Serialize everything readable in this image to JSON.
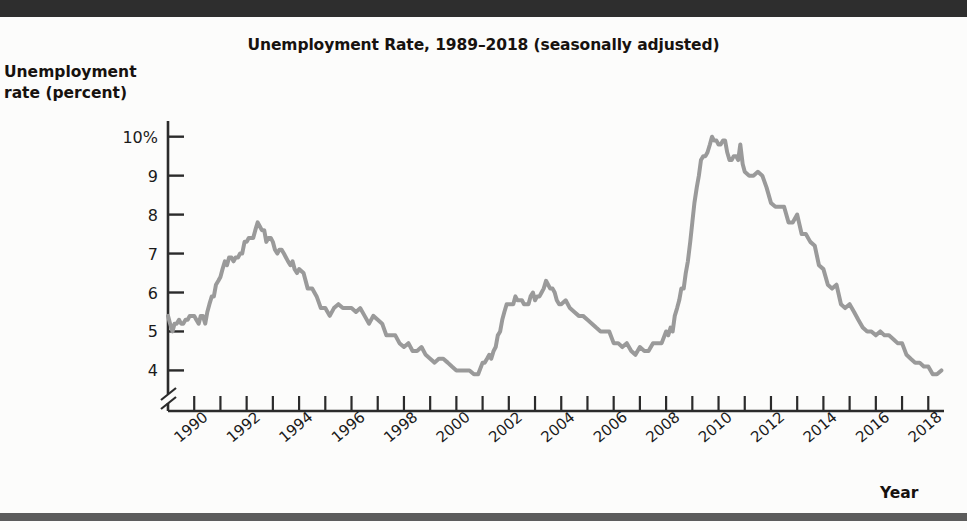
{
  "figure": {
    "title": "Unemployment Rate, 1989–2018 (seasonally adjusted)",
    "y_axis_label_line1": "Unemployment",
    "y_axis_label_line2": "rate (percent)",
    "x_axis_label": "Year"
  },
  "chart_data": {
    "type": "line",
    "title": "Unemployment Rate, 1989–2018 (seasonally adjusted)",
    "xlabel": "Year",
    "ylabel": "Unemployment rate (percent)",
    "xlim": [
      1989.0,
      2018.6
    ],
    "ylim": [
      3.6,
      10.3
    ],
    "yticks": [
      4,
      5,
      6,
      7,
      8,
      9,
      10
    ],
    "ytick_labels": [
      "4",
      "5",
      "6",
      "7",
      "8",
      "9",
      "10%"
    ],
    "y_axis_break": true,
    "grid": false,
    "legend": null,
    "line_color": "#9a9a9a",
    "line_width_px": 4,
    "xticks": [
      1990,
      1991,
      1992,
      1993,
      1994,
      1995,
      1996,
      1997,
      1998,
      1999,
      2000,
      2001,
      2002,
      2003,
      2004,
      2005,
      2006,
      2007,
      2008,
      2009,
      2010,
      2011,
      2012,
      2013,
      2014,
      2015,
      2016,
      2017,
      2018
    ],
    "xtick_labels": [
      "1990",
      "",
      "1992",
      "",
      "1994",
      "",
      "1996",
      "",
      "1998",
      "",
      "2000",
      "",
      "2002",
      "",
      "2004",
      "",
      "2006",
      "",
      "2008",
      "",
      "2010",
      "",
      "2012",
      "",
      "2014",
      "",
      "2016",
      "",
      "2018"
    ],
    "xtick_label_rotation_deg": -40,
    "series": [
      {
        "name": "Unemployment rate",
        "x": [
          1989.0,
          1989.08,
          1989.17,
          1989.25,
          1989.33,
          1989.42,
          1989.5,
          1989.58,
          1989.67,
          1989.75,
          1989.83,
          1989.92,
          1990.0,
          1990.08,
          1990.17,
          1990.25,
          1990.33,
          1990.42,
          1990.5,
          1990.58,
          1990.67,
          1990.75,
          1990.83,
          1990.92,
          1991.0,
          1991.08,
          1991.17,
          1991.25,
          1991.33,
          1991.42,
          1991.5,
          1991.58,
          1991.67,
          1991.75,
          1991.83,
          1991.92,
          1992.0,
          1992.08,
          1992.17,
          1992.25,
          1992.33,
          1992.42,
          1992.5,
          1992.58,
          1992.67,
          1992.75,
          1992.83,
          1992.92,
          1993.0,
          1993.08,
          1993.17,
          1993.25,
          1993.33,
          1993.42,
          1993.5,
          1993.58,
          1993.67,
          1993.75,
          1993.83,
          1993.92,
          1994.0,
          1994.17,
          1994.33,
          1994.5,
          1994.67,
          1994.83,
          1995.0,
          1995.17,
          1995.33,
          1995.5,
          1995.67,
          1995.83,
          1996.0,
          1996.17,
          1996.33,
          1996.5,
          1996.67,
          1996.83,
          1997.0,
          1997.17,
          1997.33,
          1997.5,
          1997.67,
          1997.83,
          1998.0,
          1998.17,
          1998.33,
          1998.5,
          1998.67,
          1998.83,
          1999.0,
          1999.17,
          1999.33,
          1999.5,
          1999.67,
          1999.83,
          2000.0,
          2000.17,
          2000.33,
          2000.5,
          2000.67,
          2000.83,
          2001.0,
          2001.08,
          2001.17,
          2001.25,
          2001.33,
          2001.42,
          2001.5,
          2001.58,
          2001.67,
          2001.75,
          2001.83,
          2001.92,
          2002.0,
          2002.08,
          2002.17,
          2002.25,
          2002.33,
          2002.42,
          2002.5,
          2002.58,
          2002.67,
          2002.75,
          2002.83,
          2002.92,
          2003.0,
          2003.08,
          2003.17,
          2003.25,
          2003.33,
          2003.42,
          2003.5,
          2003.58,
          2003.67,
          2003.75,
          2003.83,
          2003.92,
          2004.0,
          2004.17,
          2004.33,
          2004.5,
          2004.67,
          2004.83,
          2005.0,
          2005.17,
          2005.33,
          2005.5,
          2005.67,
          2005.83,
          2006.0,
          2006.17,
          2006.33,
          2006.5,
          2006.67,
          2006.83,
          2007.0,
          2007.17,
          2007.33,
          2007.5,
          2007.67,
          2007.83,
          2008.0,
          2008.08,
          2008.17,
          2008.25,
          2008.33,
          2008.42,
          2008.5,
          2008.58,
          2008.67,
          2008.75,
          2008.83,
          2008.92,
          2009.0,
          2009.08,
          2009.17,
          2009.25,
          2009.33,
          2009.42,
          2009.5,
          2009.58,
          2009.67,
          2009.75,
          2009.83,
          2009.92,
          2010.0,
          2010.08,
          2010.17,
          2010.25,
          2010.33,
          2010.42,
          2010.5,
          2010.58,
          2010.67,
          2010.75,
          2010.83,
          2010.92,
          2011.0,
          2011.17,
          2011.33,
          2011.5,
          2011.67,
          2011.83,
          2012.0,
          2012.17,
          2012.33,
          2012.5,
          2012.67,
          2012.83,
          2013.0,
          2013.17,
          2013.33,
          2013.5,
          2013.67,
          2013.83,
          2014.0,
          2014.17,
          2014.33,
          2014.5,
          2014.67,
          2014.83,
          2015.0,
          2015.17,
          2015.33,
          2015.5,
          2015.67,
          2015.83,
          2016.0,
          2016.17,
          2016.33,
          2016.5,
          2016.67,
          2016.83,
          2017.0,
          2017.17,
          2017.33,
          2017.5,
          2017.67,
          2017.83,
          2018.0,
          2018.17,
          2018.33,
          2018.5
        ],
        "y": [
          5.4,
          5.2,
          5.0,
          5.2,
          5.2,
          5.3,
          5.2,
          5.2,
          5.3,
          5.3,
          5.4,
          5.4,
          5.4,
          5.3,
          5.2,
          5.4,
          5.4,
          5.2,
          5.5,
          5.7,
          5.9,
          5.9,
          6.2,
          6.3,
          6.4,
          6.6,
          6.8,
          6.7,
          6.9,
          6.9,
          6.8,
          6.9,
          6.9,
          7.0,
          7.0,
          7.3,
          7.3,
          7.4,
          7.4,
          7.4,
          7.6,
          7.8,
          7.7,
          7.6,
          7.6,
          7.3,
          7.4,
          7.4,
          7.3,
          7.1,
          7.0,
          7.1,
          7.1,
          7.0,
          6.9,
          6.8,
          6.7,
          6.8,
          6.6,
          6.5,
          6.6,
          6.5,
          6.1,
          6.1,
          5.9,
          5.6,
          5.6,
          5.4,
          5.6,
          5.7,
          5.6,
          5.6,
          5.6,
          5.5,
          5.6,
          5.4,
          5.2,
          5.4,
          5.3,
          5.2,
          4.9,
          4.9,
          4.9,
          4.7,
          4.6,
          4.7,
          4.5,
          4.5,
          4.6,
          4.4,
          4.3,
          4.2,
          4.3,
          4.3,
          4.2,
          4.1,
          4.0,
          4.0,
          4.0,
          4.0,
          3.9,
          3.9,
          4.2,
          4.2,
          4.3,
          4.4,
          4.3,
          4.5,
          4.6,
          4.9,
          5.0,
          5.3,
          5.5,
          5.7,
          5.7,
          5.7,
          5.7,
          5.9,
          5.8,
          5.8,
          5.8,
          5.7,
          5.7,
          5.7,
          5.9,
          6.0,
          5.8,
          5.9,
          5.9,
          6.0,
          6.1,
          6.3,
          6.2,
          6.1,
          6.1,
          6.0,
          5.8,
          5.7,
          5.7,
          5.8,
          5.6,
          5.5,
          5.4,
          5.4,
          5.3,
          5.2,
          5.1,
          5.0,
          5.0,
          5.0,
          4.7,
          4.7,
          4.6,
          4.7,
          4.5,
          4.4,
          4.6,
          4.5,
          4.5,
          4.7,
          4.7,
          4.7,
          5.0,
          4.9,
          5.1,
          5.0,
          5.4,
          5.6,
          5.8,
          6.1,
          6.1,
          6.5,
          6.8,
          7.3,
          7.8,
          8.3,
          8.7,
          9.0,
          9.4,
          9.5,
          9.5,
          9.6,
          9.8,
          10.0,
          9.9,
          9.9,
          9.8,
          9.8,
          9.9,
          9.9,
          9.6,
          9.4,
          9.4,
          9.5,
          9.5,
          9.4,
          9.8,
          9.3,
          9.1,
          9.0,
          9.0,
          9.1,
          9.0,
          8.7,
          8.3,
          8.2,
          8.2,
          8.2,
          7.8,
          7.8,
          8.0,
          7.5,
          7.5,
          7.3,
          7.2,
          6.7,
          6.6,
          6.2,
          6.1,
          6.2,
          5.7,
          5.6,
          5.7,
          5.5,
          5.3,
          5.1,
          5.0,
          5.0,
          4.9,
          5.0,
          4.9,
          4.9,
          4.8,
          4.7,
          4.7,
          4.4,
          4.3,
          4.2,
          4.2,
          4.1,
          4.1,
          3.9,
          3.9,
          4.0
        ]
      }
    ],
    "annotations": [
      {
        "label": "peak-1992",
        "x": 1992.42,
        "y": 7.8
      },
      {
        "label": "trough-2000",
        "x": 2000.83,
        "y": 3.9
      },
      {
        "label": "peak-2003",
        "x": 2003.42,
        "y": 6.3
      },
      {
        "label": "peak-2009",
        "x": 2009.75,
        "y": 10.0
      },
      {
        "label": "end-2018",
        "x": 2018.5,
        "y": 4.0
      }
    ]
  },
  "geometry": {
    "plot_left_px": 168,
    "plot_right_px": 944,
    "y_top_value": 10.3,
    "y_bottom_value": 3.6,
    "y_top_px": 125,
    "y_bottom_px": 386,
    "x_left_value": 1989.0,
    "x_right_value": 2018.6,
    "axis_bottom_px": 411
  }
}
